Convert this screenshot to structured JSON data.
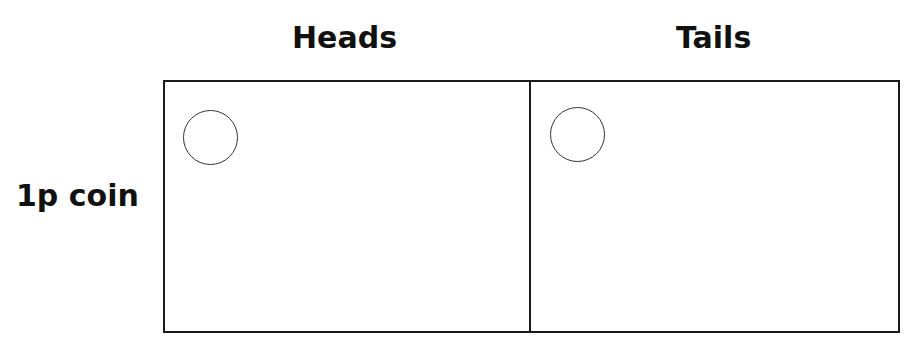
{
  "table": {
    "columns": [
      {
        "label": "Heads"
      },
      {
        "label": "Tails"
      }
    ],
    "rows": [
      {
        "label": "1p coin",
        "cells": [
          "empty-circle",
          "empty-circle"
        ]
      }
    ]
  },
  "colors": {
    "line": "#1a1a1a",
    "text": "#111111",
    "background": "#ffffff"
  }
}
